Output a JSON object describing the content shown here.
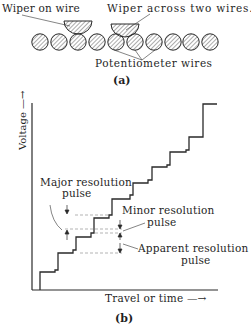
{
  "panel_a": {
    "labels": {
      "wiper_on_wire": "Wiper on wire",
      "wiper_across": "Wiper across two wires.",
      "potentiometer_wires": "Potentiometer wires"
    },
    "caption": "(a)",
    "wire_count": 10
  },
  "panel_b": {
    "y_axis_label": "Voltage —→",
    "x_axis_label": "Travel  or  time —→",
    "annotations": {
      "major_line1": "Major  resolution",
      "major_line2": "pulse",
      "minor_line1": "Minor resolution",
      "minor_line2": "pulse",
      "apparent_line1": "Apparent  resolution",
      "apparent_line2": "pulse"
    },
    "caption": "(b)"
  },
  "colors": {
    "ink": "#2a2a2a",
    "background": "#ffffff"
  }
}
